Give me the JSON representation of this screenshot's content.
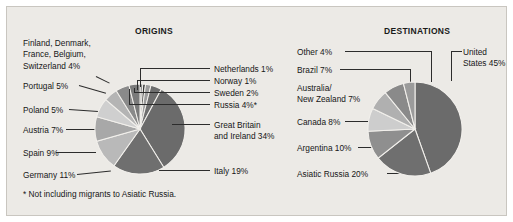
{
  "figure": {
    "background_color": "#eceae6",
    "footnote": "* Not including migrants to Asiatic Russia."
  },
  "origins": {
    "title": "ORIGINS",
    "labels": {
      "nordic_group": "Finland, Denmark, France, Belgium, Switzerland  4%",
      "nordic_line1": "Finland, Denmark,",
      "nordic_line2": "France, Belgium,",
      "nordic_line3": "Switzerland  4%",
      "portugal": "Portugal  5%",
      "poland": "Poland  5%",
      "austria": "Austria  7%",
      "spain": "Spain  9%",
      "germany": "Germany  11%",
      "netherlands": "Netherlands  1%",
      "norway": "Norway  1%",
      "sweden": "Sweden  2%",
      "russia": "Russia  4%*",
      "gb_line1": "Great Britain",
      "gb_line2": "and Ireland  34%",
      "italy": "Italy  19%"
    }
  },
  "destinations": {
    "title": "DESTINATIONS",
    "labels": {
      "other": "Other  4%",
      "brazil": "Brazil  7%",
      "anz_line1": "Australia/",
      "anz_line2": "New Zealand  7%",
      "canada": "Canada  8%",
      "argentina": "Argentina  10%",
      "asiatic_russia": "Asiatic Russia  20%",
      "us_line1": "United",
      "us_line2": "States 45%"
    }
  },
  "chart_data": [
    {
      "type": "pie",
      "title": "ORIGINS",
      "units": "percent",
      "start_angle_deg": 0,
      "direction": "clockwise",
      "categories": [
        "Netherlands",
        "Norway",
        "Sweden",
        "Russia*",
        "Great Britain and Ireland",
        "Italy",
        "Germany",
        "Spain",
        "Austria",
        "Poland",
        "Portugal",
        "Finland, Denmark, France, Belgium, Switzerland"
      ],
      "values": [
        1,
        1,
        2,
        4,
        34,
        19,
        11,
        9,
        7,
        5,
        5,
        4
      ],
      "colors": [
        "#8d8d8d",
        "#3c3c3c",
        "#9c9c9c",
        "#6e6e6e",
        "#6b6b6b",
        "#6f6f6f",
        "#b9b9b9",
        "#a8a8a8",
        "#cfcfcf",
        "#b4b4b4",
        "#8a8a8a",
        "#7a7a7a"
      ],
      "annotations": [
        "* Not including migrants to Asiatic Russia."
      ],
      "legend": "callout-labels"
    },
    {
      "type": "pie",
      "title": "DESTINATIONS",
      "units": "percent",
      "start_angle_deg": 0,
      "direction": "clockwise",
      "categories": [
        "United States",
        "Asiatic Russia",
        "Argentina",
        "Canada",
        "Australia/New Zealand",
        "Brazil",
        "Other"
      ],
      "values": [
        45,
        20,
        10,
        8,
        7,
        7,
        4
      ],
      "colors": [
        "#6b6b6b",
        "#6f6f6f",
        "#8f8f8f",
        "#cdcdcd",
        "#b0b0b0",
        "#8a8a8a",
        "#9b9b9b"
      ],
      "legend": "callout-labels"
    }
  ]
}
